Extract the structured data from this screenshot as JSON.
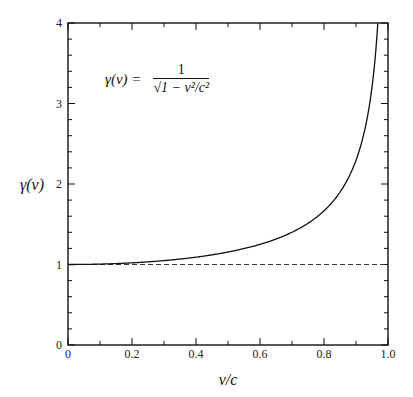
{
  "chart_data": {
    "type": "line",
    "title": "",
    "xlabel": "v/c",
    "ylabel": "γ(v)",
    "xlim": [
      0,
      1.0
    ],
    "ylim": [
      0,
      4
    ],
    "x_ticks": [
      "0",
      "0.2",
      "0.4",
      "0.6",
      "0.8",
      "1.0"
    ],
    "y_ticks": [
      "0",
      "1",
      "2",
      "3",
      "4"
    ],
    "grid": false,
    "legend": null,
    "annotation": {
      "lhs": "γ(v) =",
      "numerator": "1",
      "denominator": "√(1 − v²/c²)"
    },
    "series": [
      {
        "name": "γ(v) = 1/√(1 − v²/c²)",
        "style": "solid",
        "x": [
          0,
          0.1,
          0.2,
          0.3,
          0.4,
          0.5,
          0.6,
          0.7,
          0.8,
          0.85,
          0.9,
          0.93,
          0.95,
          0.968
        ],
        "y": [
          1.0,
          1.005,
          1.021,
          1.048,
          1.091,
          1.155,
          1.25,
          1.4,
          1.667,
          1.898,
          2.294,
          2.721,
          3.203,
          4.0
        ]
      },
      {
        "name": "γ = 1 reference",
        "style": "dashed",
        "x": [
          0,
          1.0
        ],
        "y": [
          1,
          1
        ]
      }
    ]
  },
  "labels": {
    "x_axis": "v/c",
    "y_axis": "γ(v)",
    "formula_lhs": "γ(v) =",
    "formula_num": "1",
    "formula_den": "√1 − v²/c²"
  }
}
